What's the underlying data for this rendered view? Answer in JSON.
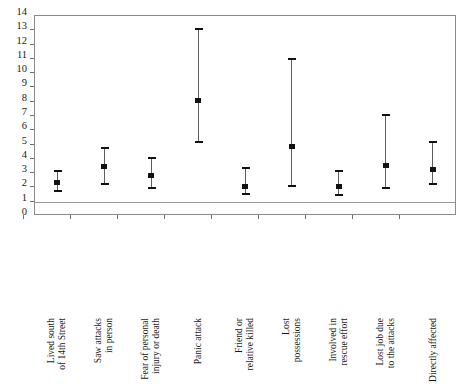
{
  "chart_data": {
    "type": "scatter",
    "title": "",
    "subtitle": "",
    "xlabel": "",
    "ylabel": "",
    "ylim": [
      0,
      14
    ],
    "yticks": [
      0,
      1,
      2,
      3,
      4,
      5,
      6,
      7,
      8,
      9,
      10,
      11,
      12,
      13,
      14
    ],
    "ytick_labels": [
      "0",
      "1",
      "2",
      "3",
      "4",
      "5",
      "6",
      "7",
      "8",
      "9",
      "10",
      "11",
      "12",
      "13",
      "14"
    ],
    "grid": false,
    "legend": "none",
    "reference_line": 1,
    "categories": [
      "Lived south of 14th Street",
      "Saw attacks in person",
      "Fear of personal injury or death",
      "Panic attack",
      "Friend or relative killed",
      "Lost possessions",
      "Involved in rescue effort",
      "Lost job due to the attacks",
      "Directly affected"
    ],
    "category_lines": [
      [
        "Lived south",
        "of 14th Street"
      ],
      [
        "Saw attacks",
        "in person"
      ],
      [
        "Fear of personal",
        "injury or death"
      ],
      [
        "Panic attack",
        ""
      ],
      [
        "Friend or",
        "relative killed"
      ],
      [
        "Lost",
        "possessions"
      ],
      [
        "Involved in",
        "rescue effort"
      ],
      [
        "Lost job due",
        "to the attacks"
      ],
      [
        "Directly affected",
        ""
      ]
    ],
    "values": [
      2.3,
      3.4,
      2.8,
      8.0,
      2.0,
      4.8,
      2.0,
      3.5,
      3.2
    ],
    "lower": [
      1.7,
      2.2,
      1.9,
      5.1,
      1.5,
      2.0,
      1.4,
      1.9,
      2.2
    ],
    "upper": [
      3.1,
      4.7,
      4.0,
      13.0,
      3.3,
      10.9,
      3.1,
      7.0,
      5.1
    ],
    "series": [
      {
        "name": "point estimate",
        "values": [
          2.3,
          3.4,
          2.8,
          8.0,
          2.0,
          4.8,
          2.0,
          3.5,
          3.2
        ]
      },
      {
        "name": "lower confidence limit",
        "values": [
          1.7,
          2.2,
          1.9,
          5.1,
          1.5,
          2.0,
          1.4,
          1.9,
          2.2
        ]
      },
      {
        "name": "upper confidence limit",
        "values": [
          3.1,
          4.7,
          4.0,
          13.0,
          3.3,
          10.9,
          3.1,
          7.0,
          5.1
        ]
      }
    ],
    "colors": {
      "marker": "#121212",
      "whisker": "#5d5d5d",
      "frame": "#8a8a8a",
      "reference_line": "#9a9a9a",
      "background": "#ffffff"
    }
  }
}
